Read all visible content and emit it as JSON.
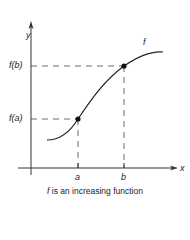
{
  "diagram": {
    "axes": {
      "y_label": "y",
      "x_label": "x"
    },
    "curve_label": "f",
    "points": [
      {
        "name": "a",
        "x_label": "a",
        "y_label": "f(a)"
      },
      {
        "name": "b",
        "x_label": "b",
        "y_label": "f(b)"
      }
    ],
    "caption_var": "f",
    "caption_text": " is an increasing function"
  }
}
